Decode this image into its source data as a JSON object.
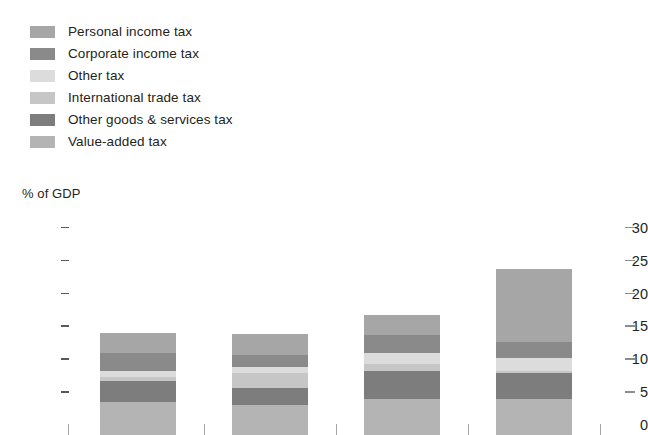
{
  "axis_title": "% of GDP",
  "legend": {
    "items": [
      {
        "label": "Personal income tax",
        "color": "#a6a6a6"
      },
      {
        "label": "Corporate income tax",
        "color": "#8a8a8a"
      },
      {
        "label": "Other tax",
        "color": "#dcdcdc"
      },
      {
        "label": "International trade tax",
        "color": "#c6c6c6"
      },
      {
        "label": "Other goods & services tax",
        "color": "#7d7d7d"
      },
      {
        "label": "Value-added tax",
        "color": "#b4b4b4"
      }
    ]
  },
  "yaxis": {
    "ticks": [
      "30",
      "25",
      "20",
      "15",
      "10",
      "5",
      "0"
    ],
    "values": [
      30,
      25,
      20,
      15,
      10,
      5,
      0
    ]
  },
  "chart_data": {
    "type": "bar",
    "subtype": "stacked-bar",
    "title": "",
    "xlabel": "",
    "ylabel": "% of GDP",
    "ylim": [
      0,
      30
    ],
    "yticks": [
      0,
      5,
      10,
      15,
      20,
      25,
      30
    ],
    "grid": false,
    "legend_position": "above-plot",
    "categories": [
      "",
      "",
      "",
      ""
    ],
    "series": [
      {
        "name": "Value-added tax",
        "color": "#b4b4b4",
        "values": [
          5.0,
          4.6,
          5.5,
          5.5
        ]
      },
      {
        "name": "Other goods & services tax",
        "color": "#7d7d7d",
        "values": [
          3.2,
          2.6,
          4.2,
          4.0
        ]
      },
      {
        "name": "International trade tax",
        "color": "#c6c6c6",
        "values": [
          0.6,
          2.2,
          1.1,
          0.3
        ]
      },
      {
        "name": "Other tax",
        "color": "#dcdcdc",
        "values": [
          0.9,
          0.9,
          1.7,
          1.9
        ]
      },
      {
        "name": "Corporate income tax",
        "color": "#8a8a8a",
        "values": [
          2.8,
          1.9,
          2.7,
          2.5
        ]
      },
      {
        "name": "Personal income tax",
        "color": "#a6a6a6",
        "values": [
          3.0,
          3.2,
          3.0,
          11.0
        ]
      }
    ],
    "totals": [
      15.5,
      15.4,
      18.2,
      25.2
    ]
  }
}
